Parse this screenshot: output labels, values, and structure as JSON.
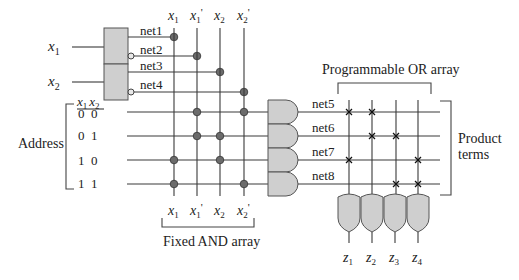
{
  "diagram": {
    "type": "PLA / ROM decoder schematic",
    "inputs": [
      {
        "name": "x",
        "sub": "1"
      },
      {
        "name": "x",
        "sub": "2"
      }
    ],
    "nets_decoder": [
      "net1",
      "net2",
      "net3",
      "net4"
    ],
    "nets_inverted": [
      false,
      true,
      false,
      true
    ],
    "and_columns": [
      {
        "name": "x",
        "sub": "1",
        "prime": ""
      },
      {
        "name": "x",
        "sub": "1",
        "prime": "'"
      },
      {
        "name": "x",
        "sub": "2",
        "prime": ""
      },
      {
        "name": "x",
        "sub": "2",
        "prime": "'"
      }
    ],
    "address": {
      "label": "Address",
      "header": [
        "x1",
        "x2"
      ],
      "header_parts": [
        {
          "name": "x",
          "sub": "1"
        },
        {
          "name": "x",
          "sub": "2"
        }
      ],
      "rows": [
        "0  0",
        "0  1",
        "1  0",
        "1  1"
      ]
    },
    "and_connections": [
      [
        false,
        true,
        false,
        true
      ],
      [
        false,
        true,
        true,
        false
      ],
      [
        true,
        false,
        true,
        false
      ],
      [
        true,
        false,
        false,
        true
      ]
    ],
    "product_nets": [
      "net5",
      "net6",
      "net7",
      "net8"
    ],
    "or_connections": [
      [
        true,
        true,
        false,
        false
      ],
      [
        false,
        true,
        true,
        false
      ],
      [
        true,
        false,
        false,
        true
      ],
      [
        false,
        false,
        true,
        true
      ]
    ],
    "outputs": [
      {
        "name": "z",
        "sub": "1"
      },
      {
        "name": "z",
        "sub": "2"
      },
      {
        "name": "z",
        "sub": "3"
      },
      {
        "name": "z",
        "sub": "4"
      }
    ],
    "labels": {
      "fixed_and": "Fixed AND array",
      "programmable_or": "Programmable OR array",
      "product_terms_1": "Product",
      "product_terms_2": "terms"
    },
    "colors": {
      "gate_fill": "#cfcfcf",
      "wire": "#3a3a3a",
      "dot": "#6b6b6b"
    }
  }
}
